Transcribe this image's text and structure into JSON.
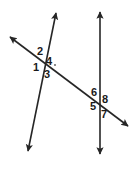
{
  "figure": {
    "name": "two-lines-cut-by-transversal",
    "background_color": "#ffffff",
    "stroke_color": "#262626",
    "label_color": "#1a1a1a",
    "width": 137,
    "height": 174,
    "lines": [
      {
        "id": "line-left",
        "name": "left-slanted-line",
        "x1": 56,
        "y1": 13,
        "x2": 28,
        "y2": 151,
        "arrow_start": true,
        "arrow_end": true,
        "stroke_width": 1.6
      },
      {
        "id": "line-right",
        "name": "right-vertical-line",
        "x1": 100,
        "y1": 12,
        "x2": 100,
        "y2": 154,
        "arrow_start": true,
        "arrow_end": true,
        "stroke_width": 1.6
      },
      {
        "id": "line-transversal",
        "name": "transversal-line",
        "x1": 10,
        "y1": 37,
        "x2": 128,
        "y2": 126,
        "arrow_start": true,
        "arrow_end": true,
        "stroke_width": 1.6
      }
    ],
    "intersections": [
      {
        "id": "intersection-a",
        "name": "upper-left-intersection",
        "x": 41,
        "y": 61
      },
      {
        "id": "intersection-b",
        "name": "lower-right-intersection",
        "x": 100,
        "y": 101
      }
    ],
    "dot": {
      "name": "label-dot-after-4",
      "x": 55,
      "y": 65,
      "r": 0.9
    },
    "angle_labels": [
      {
        "id": "angle-2",
        "name": "angle-label-2",
        "text": "2",
        "x": 37,
        "y": 46,
        "position": "upper-left-of-intersection-a"
      },
      {
        "id": "angle-4",
        "name": "angle-label-4",
        "text": "4",
        "x": 46,
        "y": 56,
        "position": "upper-right-of-intersection-a"
      },
      {
        "id": "angle-1",
        "name": "angle-label-1",
        "text": "1",
        "x": 33,
        "y": 62,
        "position": "lower-left-of-intersection-a"
      },
      {
        "id": "angle-3",
        "name": "angle-label-3",
        "text": "3",
        "x": 44,
        "y": 69,
        "position": "lower-right-of-intersection-a"
      },
      {
        "id": "angle-6",
        "name": "angle-label-6",
        "text": "6",
        "x": 91,
        "y": 87,
        "position": "upper-left-of-intersection-b"
      },
      {
        "id": "angle-8",
        "name": "angle-label-8",
        "text": "8",
        "x": 102,
        "y": 94,
        "position": "upper-right-of-intersection-b"
      },
      {
        "id": "angle-5",
        "name": "angle-label-5",
        "text": "5",
        "x": 90,
        "y": 101,
        "position": "lower-left-of-intersection-b"
      },
      {
        "id": "angle-7",
        "name": "angle-label-7",
        "text": "7",
        "x": 101,
        "y": 109,
        "position": "lower-right-of-intersection-b"
      }
    ]
  }
}
